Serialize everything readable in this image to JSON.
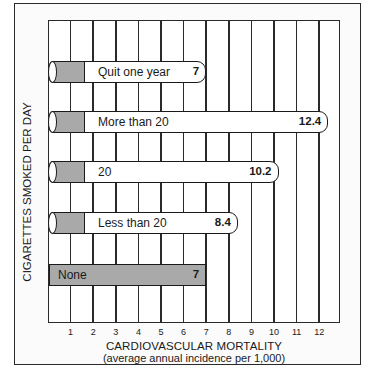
{
  "chart_data": {
    "type": "bar",
    "orientation": "horizontal",
    "title": "",
    "xlabel": "CARDIOVASCULAR MORTALITY",
    "xlabel_sub": "(average annual incidence per 1,000)",
    "ylabel": "CIGARETTES SMOKED PER DAY",
    "categories": [
      "Quit one year",
      "More than 20",
      "20",
      "Less than 20",
      "None"
    ],
    "values": [
      7,
      12.4,
      10.2,
      8.4,
      7
    ],
    "value_labels": [
      "7",
      "12.4",
      "10.2",
      "8.4",
      "7"
    ],
    "x_ticks": [
      "1",
      "2",
      "3",
      "4",
      "5",
      "6",
      "7",
      "8",
      "9",
      "10",
      "11",
      "12"
    ],
    "xlim": [
      0,
      13
    ],
    "grid": "vertical",
    "legend": null,
    "colors": {
      "bar_fill": "#ffffff",
      "cap_fill": "#a9a9a9",
      "none_fill": "#a9a9a9",
      "outline": "#1a1a1a"
    }
  }
}
